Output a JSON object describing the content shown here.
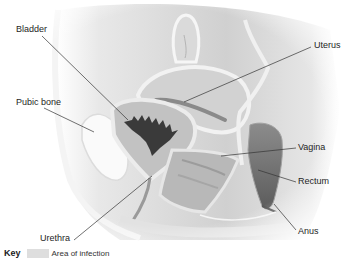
{
  "diagram": {
    "labels": [
      {
        "id": "bladder",
        "text": "Bladder",
        "x": 16,
        "y": 24,
        "line": [
          [
            42,
            36
          ],
          [
            120,
            120
          ]
        ]
      },
      {
        "id": "uterus",
        "text": "Uterus",
        "x": 314,
        "y": 40,
        "line": [
          [
            311,
            47
          ],
          [
            184,
            102
          ]
        ]
      },
      {
        "id": "pubic-bone",
        "text": "Pubic bone",
        "x": 16,
        "y": 97,
        "line": [
          [
            44,
            108
          ],
          [
            94,
            132
          ]
        ]
      },
      {
        "id": "vagina",
        "text": "Vagina",
        "x": 298,
        "y": 142,
        "line": [
          [
            296,
            148
          ],
          [
            221,
            156
          ]
        ]
      },
      {
        "id": "rectum",
        "text": "Rectum",
        "x": 298,
        "y": 176,
        "line": [
          [
            296,
            182
          ],
          [
            258,
            170
          ]
        ]
      },
      {
        "id": "anus",
        "text": "Anus",
        "x": 298,
        "y": 226,
        "line": [
          [
            296,
            230
          ],
          [
            274,
            204
          ]
        ]
      },
      {
        "id": "urethra",
        "text": "Urethra",
        "x": 40,
        "y": 233,
        "line": [
          [
            74,
            240
          ],
          [
            152,
            176
          ]
        ]
      }
    ]
  },
  "key": {
    "title": "Key",
    "swatch_color": "#dedede",
    "description": "Area of infection"
  },
  "colors": {
    "background": "#ffffff",
    "tissue_light": "#e4e4e4",
    "tissue_mid": "#c4c4c4",
    "tissue_dark": "#8a8a8a",
    "infection_dark": "#3a3a3a",
    "rectum_dark": "#6e6e6e",
    "leader_line": "#333333"
  }
}
